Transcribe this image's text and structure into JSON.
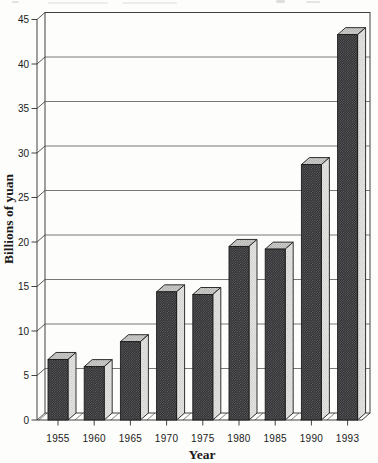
{
  "figure": {
    "ylabel": "Billions of yuan",
    "xlabel": "Year"
  },
  "chart_data": {
    "type": "bar",
    "categories": [
      "1955",
      "1960",
      "1965",
      "1970",
      "1975",
      "1980",
      "1985",
      "1990",
      "1993"
    ],
    "values": [
      6.8,
      6.0,
      8.8,
      14.4,
      14.1,
      19.5,
      19.2,
      28.7,
      43.3
    ],
    "xlabel": "Year",
    "ylabel": "Billions of yuan",
    "ylim": [
      0,
      45
    ],
    "y_ticks": [
      0,
      5,
      10,
      15,
      20,
      25,
      30,
      35,
      40,
      45
    ],
    "grid": true,
    "legend": false,
    "style": "3d-column-grayscale-halftone-scan"
  },
  "colors": {
    "paper": "#fdfdfb",
    "bar_front_base": "#6d6d70",
    "bar_front_dot": "#232325",
    "bar_side_base": "#e9e9e7",
    "bar_side_dot": "#b4b4b2",
    "bar_top_base": "#d8d8d6",
    "bar_top_dot": "#9d9d9b",
    "outline": "#1c1c1c",
    "grid": "#4b4b4b",
    "axis": "#2e2e2e",
    "text": "#1a1a1a"
  }
}
